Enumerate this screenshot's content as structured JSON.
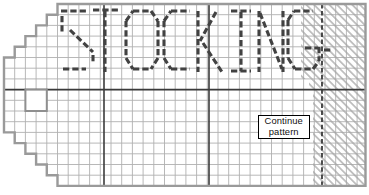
{
  "canvas": {
    "width": 369,
    "height": 195,
    "background": "#ffffff"
  },
  "chart": {
    "word": "STOCKING",
    "grid": {
      "origin_x": 4,
      "origin_y": 4,
      "cell_w": 10.7,
      "cell_h": 10.7,
      "right_edge": 365.5,
      "bottom_edge": 185.9,
      "line_color": "#b0b0b0",
      "line_width": 0.9
    },
    "outline": {
      "color": "#9a9a9a",
      "width": 2.4,
      "points": [
        [
          57.5,
          4
        ],
        [
          365.5,
          4
        ],
        [
          365.5,
          185.9
        ],
        [
          57.5,
          185.9
        ],
        [
          57.5,
          175.2
        ],
        [
          46.8,
          175.2
        ],
        [
          46.8,
          164.5
        ],
        [
          36.1,
          164.5
        ],
        [
          36.1,
          153.8
        ],
        [
          25.4,
          153.8
        ],
        [
          25.4,
          143.1
        ],
        [
          14.7,
          143.1
        ],
        [
          14.7,
          132.4
        ],
        [
          4,
          132.4
        ],
        [
          4,
          57.5
        ],
        [
          14.7,
          57.5
        ],
        [
          14.7,
          46.8
        ],
        [
          25.4,
          46.8
        ],
        [
          25.4,
          36.1
        ],
        [
          36.1,
          36.1
        ],
        [
          36.1,
          25.4
        ],
        [
          46.8,
          25.4
        ],
        [
          46.8,
          14.7
        ],
        [
          57.5,
          14.7
        ]
      ]
    },
    "heavy_lines": {
      "color": "#3a3a3a",
      "width": 1.6,
      "verticals_x": [
        104,
        209
      ],
      "horizontal_y": 89.6,
      "dashed_vertical": {
        "x": 322,
        "width": 1.8,
        "dash": "4.5 2.6"
      }
    },
    "center_square": {
      "x": 25.4,
      "y": 89.6,
      "w": 21.4,
      "h": 21.4,
      "stroke": "#8f8f8f",
      "stroke_width": 2,
      "fill": "#ffffff"
    },
    "hatch": {
      "line_color": "#a2a2a2",
      "line_width": 1.25,
      "period": 5.4,
      "angle": 45,
      "regions": [
        {
          "x": 301,
          "y": 4,
          "w": 64.5,
          "h": 75
        },
        {
          "x": 309,
          "y": 79,
          "w": 56.5,
          "h": 10.6
        },
        {
          "x": 313,
          "y": 89.6,
          "w": 52.5,
          "h": 96.3
        }
      ]
    },
    "letters": {
      "stroke": "#424242",
      "width": 3.1,
      "dash": "6.3 3",
      "glyphs": [
        {
          "char": "S",
          "segments": [
            [
              61,
              11,
              87,
              11
            ],
            [
              62,
              16,
              62,
              33
            ],
            [
              70,
              30,
              93,
              52
            ],
            [
              93,
              55,
              93,
              64
            ],
            [
              63,
              69,
              86,
              69
            ]
          ]
        },
        {
          "char": "T",
          "segments": [
            [
              93,
              10,
              119,
              10
            ],
            [
              105,
              11,
              105,
              72
            ]
          ]
        },
        {
          "char": "O",
          "segments": [
            [
              133,
              11,
              151,
              11
            ],
            [
              151,
              11,
              158,
              21
            ],
            [
              158,
              21,
              158,
              58
            ],
            [
              158,
              58,
              151,
              69
            ],
            [
              133,
              69,
              151,
              69
            ],
            [
              126,
              58,
              133,
              69
            ],
            [
              126,
              21,
              126,
              58
            ],
            [
              126,
              21,
              133,
              11
            ]
          ]
        },
        {
          "char": "C",
          "segments": [
            [
              171,
              11,
              190,
              11
            ],
            [
              164,
              21,
              171,
              11
            ],
            [
              164,
              21,
              164,
              58
            ],
            [
              164,
              58,
              171,
              69
            ],
            [
              171,
              69,
              190,
              69
            ]
          ]
        },
        {
          "char": "K",
          "segments": [
            [
              198,
              11,
              198,
              72
            ],
            [
              216,
              12,
              200,
              41
            ],
            [
              203,
              43,
              222,
              72
            ]
          ]
        },
        {
          "char": "I",
          "segments": [
            [
              231,
              11,
              251,
              11
            ],
            [
              241,
              12,
              241,
              71
            ],
            [
              231,
              71,
              251,
              71
            ]
          ]
        },
        {
          "char": "N",
          "segments": [
            [
              259,
              11,
              259,
              72
            ],
            [
              260,
              13,
              282,
              69
            ],
            [
              283,
              11,
              283,
              72
            ]
          ]
        },
        {
          "char": "G",
          "segments": [
            [
              294,
              11,
              313,
              11
            ],
            [
              288,
              20,
              294,
              11
            ],
            [
              288,
              20,
              288,
              58
            ],
            [
              288,
              58,
              295,
              69
            ],
            [
              295,
              69,
              313,
              69
            ],
            [
              313,
              69,
              319,
              61
            ],
            [
              319,
              47,
              319,
              61
            ],
            [
              305,
              48,
              318,
              48
            ],
            [
              324,
              50,
              332,
              50
            ]
          ]
        }
      ]
    }
  },
  "annotation": {
    "line1": "Continue",
    "line2": "pattern",
    "box": {
      "x": 257.5,
      "y": 114.5,
      "w": 52.5,
      "h": 24
    }
  }
}
